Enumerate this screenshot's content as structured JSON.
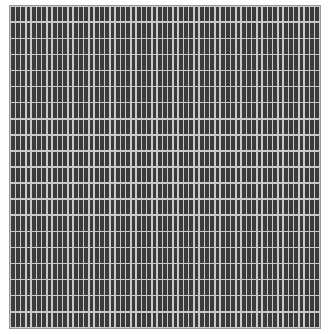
{
  "pattern": {
    "type": "rectangular-grid",
    "columns": 59,
    "rows": 20,
    "cell_color": "#3b3b3b",
    "gap_color": "#c9c9c9",
    "border_color": "#9a9a9a",
    "background_color": "#ffffff"
  }
}
